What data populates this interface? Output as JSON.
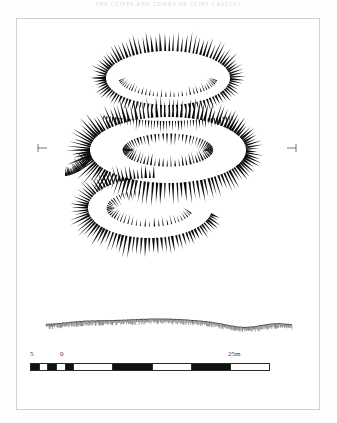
{
  "page": {
    "running_head": "The Cliffs and Towns of Cliff Castles",
    "background_color": "#fefefe",
    "frame_color": "#d0d0d4",
    "ink_color": "#111111"
  },
  "figure": {
    "type": "archaeological-earthwork-hachure-plan",
    "registration_marks": [
      {
        "name": "left-registration-tick",
        "x": 42,
        "y": 148,
        "glyph": "tick-right"
      },
      {
        "name": "right-registration-tick",
        "x": 292,
        "y": 148,
        "glyph": "tick-left"
      }
    ],
    "elements": [
      {
        "name": "upper-oval-rampart",
        "cx": 168,
        "cy": 78,
        "rx": 62,
        "ry": 27
      },
      {
        "name": "central-oval-enclosure",
        "cx": 168,
        "cy": 150,
        "rx": 78,
        "ry": 33
      },
      {
        "name": "lower-arc-rampart",
        "cx": 150,
        "cy": 208,
        "rx": 62,
        "ry": 30
      },
      {
        "name": "section-profile-line",
        "y": 325
      }
    ]
  },
  "scale_bar": {
    "name": "linear-scale-bar",
    "unit": "m",
    "labels": {
      "left": "5",
      "zero": "0",
      "right": "25m"
    },
    "minor_divisions_left_of_zero": 5,
    "major_block_length_m": 5,
    "segments": [
      {
        "fill": "black",
        "len": 1
      },
      {
        "fill": "white",
        "len": 1
      },
      {
        "fill": "black",
        "len": 1
      },
      {
        "fill": "white",
        "len": 1
      },
      {
        "fill": "black",
        "len": 1
      },
      {
        "fill": "white",
        "len": 5
      },
      {
        "fill": "black",
        "len": 5
      },
      {
        "fill": "white",
        "len": 5
      },
      {
        "fill": "black",
        "len": 5
      },
      {
        "fill": "white",
        "len": 5
      }
    ]
  }
}
